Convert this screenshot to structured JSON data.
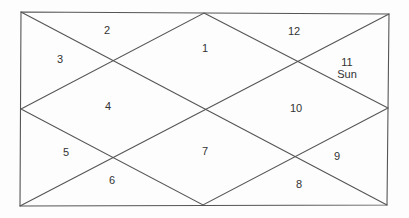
{
  "chart": {
    "style": "North Indian birth chart",
    "frame": {
      "top_left": [
        21,
        12
      ],
      "top_right": [
        389,
        14
      ],
      "bottom_right": [
        387,
        205
      ],
      "bottom_left": [
        20,
        206
      ]
    },
    "line_color": "#555555",
    "text_color": "#333333"
  },
  "houses": [
    {
      "number": "1",
      "x": 205,
      "y": 48,
      "planets": []
    },
    {
      "number": "2",
      "x": 107,
      "y": 30,
      "planets": []
    },
    {
      "number": "3",
      "x": 60,
      "y": 59,
      "planets": []
    },
    {
      "number": "4",
      "x": 108,
      "y": 106,
      "planets": []
    },
    {
      "number": "5",
      "x": 66,
      "y": 152,
      "planets": []
    },
    {
      "number": "6",
      "x": 112,
      "y": 180,
      "planets": []
    },
    {
      "number": "7",
      "x": 205,
      "y": 151,
      "planets": []
    },
    {
      "number": "8",
      "x": 299,
      "y": 184,
      "planets": []
    },
    {
      "number": "9",
      "x": 337,
      "y": 156,
      "planets": []
    },
    {
      "number": "10",
      "x": 296,
      "y": 108,
      "planets": []
    },
    {
      "number": "11",
      "x": 347,
      "y": 68,
      "planets": [
        "Sun"
      ]
    },
    {
      "number": "12",
      "x": 294,
      "y": 31,
      "planets": []
    }
  ]
}
